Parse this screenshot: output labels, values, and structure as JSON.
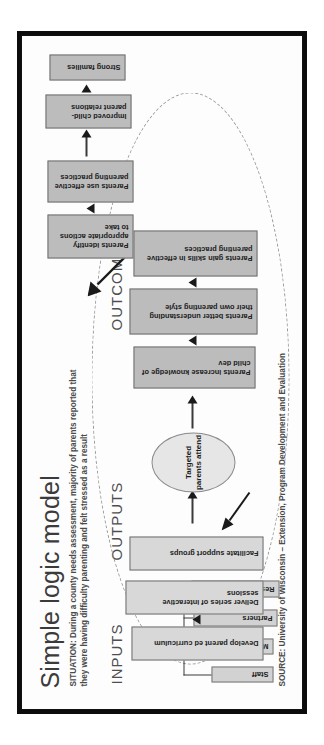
{
  "document": {
    "title": "Simple logic model",
    "situation": "SITUATION: During a county needs assessment, majority of parents reported that they were having difficulty parenting and felt stressed as a result",
    "source": "SOURCE: University of Wisconsin – Extension, Program Development and Evaluation"
  },
  "stages": {
    "inputs_label": "INPUTS",
    "outputs_label": "OUTPUTS",
    "outcomes_label": "OUTCOMES"
  },
  "inputs": [
    {
      "label": "Staff"
    },
    {
      "label": "Money"
    },
    {
      "label": "Partners"
    },
    {
      "label": "Research"
    }
  ],
  "outputs": {
    "activities": [
      {
        "label": "Develop parent ed curriculum"
      },
      {
        "label": "Deliver series of interactive sessions"
      },
      {
        "label": "Facilitate support groups"
      }
    ],
    "participation": {
      "label": "Targeted parents attend"
    }
  },
  "outcomes": {
    "short_term": [
      {
        "label": "Parents increase knowledge of child dev"
      },
      {
        "label": "Parents better understanding their own parenting style"
      },
      {
        "label": "Parents gain skills in effective parenting practices"
      }
    ],
    "medium_term": [
      {
        "label": "Parents identify appropriate actions to take"
      },
      {
        "label": "Parents use effective parenting practices"
      }
    ],
    "long_term": [
      {
        "label": "Improved child-parent relations"
      },
      {
        "label": "Strong families"
      }
    ]
  },
  "colors": {
    "frame": "#0c0c0c",
    "page": "#fdfdfd",
    "box_light": "#d8d8d8",
    "box_mid": "#bcbcbc",
    "oval": "#e6e6e6",
    "text": "#1d1d1d",
    "label": "#4e4e4e",
    "arrow": "#1a1a1a",
    "dashed_loop": "#9a9a9a"
  }
}
